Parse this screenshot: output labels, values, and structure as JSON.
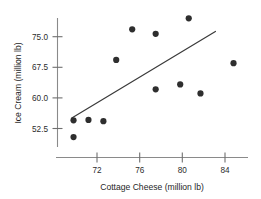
{
  "chart_data": {
    "type": "scatter",
    "title": "",
    "xlabel": "Cottage Cheese (million lb)",
    "ylabel": "Ice Cream (million lb)",
    "xlim": [
      69.0,
      86.0
    ],
    "ylim": [
      48.5,
      79.5
    ],
    "xticks": [
      72,
      76,
      80,
      84
    ],
    "xtick_labels": [
      "72",
      "76",
      "80",
      "84"
    ],
    "yticks": [
      52.5,
      60.0,
      67.5,
      75.0
    ],
    "ytick_labels": [
      "52.5",
      "60.0",
      "67.5",
      "75.0"
    ],
    "grid": false,
    "legend": null,
    "marker": "filled-circle",
    "marker_color": "#2e2e2e",
    "points": [
      {
        "x": 69.8,
        "y": 54.5
      },
      {
        "x": 69.8,
        "y": 50.4
      },
      {
        "x": 71.2,
        "y": 54.6
      },
      {
        "x": 72.6,
        "y": 54.3
      },
      {
        "x": 73.8,
        "y": 69.3
      },
      {
        "x": 75.3,
        "y": 76.8
      },
      {
        "x": 77.5,
        "y": 75.7
      },
      {
        "x": 77.5,
        "y": 62.1
      },
      {
        "x": 79.8,
        "y": 63.3
      },
      {
        "x": 80.6,
        "y": 79.5
      },
      {
        "x": 81.7,
        "y": 61.1
      },
      {
        "x": 84.8,
        "y": 68.5
      }
    ],
    "trendline": {
      "type": "linear-fit",
      "x_start": 69.6,
      "y_start": 55.0,
      "x_end": 83.1,
      "y_end": 76.3
    }
  },
  "axis": {
    "x_title": "Cottage Cheese (million lb)",
    "y_title": "Ice Cream (million lb)"
  }
}
